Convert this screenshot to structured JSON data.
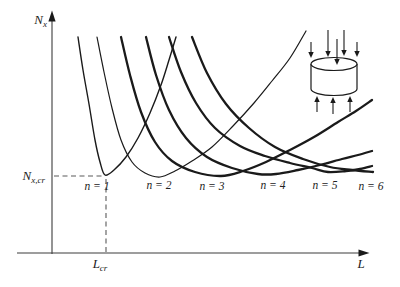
{
  "colors": {
    "ink": "#1a1a1a",
    "axis": "#3c3c3c",
    "dash": "#5a5a5a",
    "background": "#ffffff"
  },
  "axes": {
    "y_label_main": "N",
    "y_label_sub": "x",
    "x_label": "L",
    "y_critical_main": "N",
    "y_critical_sub": "x,cr",
    "x_critical_main": "L",
    "x_critical_sub": "cr"
  },
  "icon": {
    "name": "axially-compressed-cylinder",
    "description": "small cylinder sketch with axial compression arrows pressing down on the top rim and up on the bottom rim"
  },
  "chart_data": {
    "type": "line",
    "xlabel": "L",
    "ylabel": "N_x",
    "x_axis": {
      "tick_labels": [
        "L_cr"
      ],
      "grid": false
    },
    "y_axis": {
      "tick_labels": [
        "N_x,cr"
      ],
      "grid": false
    },
    "legend": "none (curves labeled inline below their minima)",
    "coordinate_note": "points are figure pixel coordinates, x to the right, y downward; qualitative sketch with no numeric scale",
    "critical_point_px": [
      105,
      176
    ],
    "annotations": [
      {
        "text": "N_x,cr",
        "type": "horizontal dashed level at minimum of n = 1 curve"
      },
      {
        "text": "L_cr",
        "type": "vertical dashed drop line at minimum of n = 1 curve"
      }
    ],
    "series": [
      {
        "id": "n1",
        "label": "n = 1",
        "stroke_width": 1.4,
        "label_pos": [
          97,
          190
        ],
        "points": [
          [
            78,
            37
          ],
          [
            83,
            70
          ],
          [
            89,
            104
          ],
          [
            95,
            140
          ],
          [
            100,
            162
          ],
          [
            105,
            175
          ],
          [
            114,
            170
          ],
          [
            126,
            157
          ],
          [
            138,
            138
          ],
          [
            150,
            113
          ],
          [
            161,
            85
          ],
          [
            169,
            60
          ],
          [
            176,
            37
          ]
        ]
      },
      {
        "id": "n2",
        "label": "n = 2",
        "stroke_width": 1.2,
        "label_pos": [
          159,
          189
        ],
        "points": [
          [
            97,
            37
          ],
          [
            104,
            72
          ],
          [
            112,
            108
          ],
          [
            121,
            140
          ],
          [
            132,
            162
          ],
          [
            145,
            173
          ],
          [
            160,
            177
          ],
          [
            175,
            171
          ],
          [
            192,
            161
          ],
          [
            212,
            147
          ],
          [
            233,
            126
          ],
          [
            254,
            103
          ],
          [
            272,
            81
          ],
          [
            290,
            58
          ],
          [
            306,
            31
          ]
        ]
      },
      {
        "id": "n3",
        "label": "n = 3",
        "stroke_width": 2.3,
        "label_pos": [
          212,
          190
        ],
        "points": [
          [
            121,
            37
          ],
          [
            130,
            75
          ],
          [
            141,
            112
          ],
          [
            155,
            142
          ],
          [
            172,
            161
          ],
          [
            195,
            172
          ],
          [
            221,
            176
          ],
          [
            243,
            171
          ],
          [
            266,
            162
          ],
          [
            290,
            150
          ],
          [
            314,
            137
          ],
          [
            338,
            122
          ],
          [
            356,
            111
          ],
          [
            372,
            100
          ]
        ]
      },
      {
        "id": "n4",
        "label": "n = 4",
        "stroke_width": 2.3,
        "label_pos": [
          273,
          189
        ],
        "points": [
          [
            146,
            37
          ],
          [
            156,
            75
          ],
          [
            169,
            110
          ],
          [
            186,
            138
          ],
          [
            207,
            157
          ],
          [
            232,
            168
          ],
          [
            258,
            174
          ],
          [
            276,
            174
          ],
          [
            298,
            170
          ],
          [
            320,
            165
          ],
          [
            342,
            159
          ],
          [
            358,
            155
          ],
          [
            372,
            151
          ]
        ]
      },
      {
        "id": "n5",
        "label": "n = 5",
        "stroke_width": 2.3,
        "label_pos": [
          325,
          189
        ],
        "points": [
          [
            169,
            37
          ],
          [
            181,
            72
          ],
          [
            196,
            103
          ],
          [
            215,
            128
          ],
          [
            240,
            146
          ],
          [
            265,
            156
          ],
          [
            290,
            163
          ],
          [
            312,
            168
          ],
          [
            328,
            172
          ],
          [
            346,
            171
          ],
          [
            360,
            169
          ],
          [
            372,
            166
          ]
        ]
      },
      {
        "id": "n6",
        "label": "n = 6",
        "stroke_width": 2.3,
        "label_pos": [
          371,
          190
        ],
        "points": [
          [
            192,
            37
          ],
          [
            207,
            73
          ],
          [
            226,
            104
          ],
          [
            249,
            128
          ],
          [
            275,
            147
          ],
          [
            303,
            159
          ],
          [
            330,
            167
          ],
          [
            352,
            170
          ],
          [
            373,
            172
          ]
        ]
      }
    ]
  }
}
